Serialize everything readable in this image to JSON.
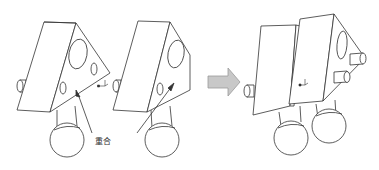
{
  "diagram": {
    "type": "assembly-illustration",
    "annotation_label": "重合",
    "colors": {
      "stroke": "#333333",
      "fill": "#ffffff",
      "arrow_fill": "#c8c8c8",
      "arrow_stroke": "#9a9a9a"
    },
    "parts": [
      {
        "name": "wedge-part-a",
        "description": "Triangular prism block with circular holes and ball joint"
      },
      {
        "name": "wedge-part-b",
        "description": "Triangular prism block with ball joint and diagonal guide line"
      },
      {
        "name": "assembled-part",
        "description": "Two blocks combined with two ball joints and cylindrical pegs"
      }
    ],
    "steps": [
      "before",
      "after"
    ]
  }
}
